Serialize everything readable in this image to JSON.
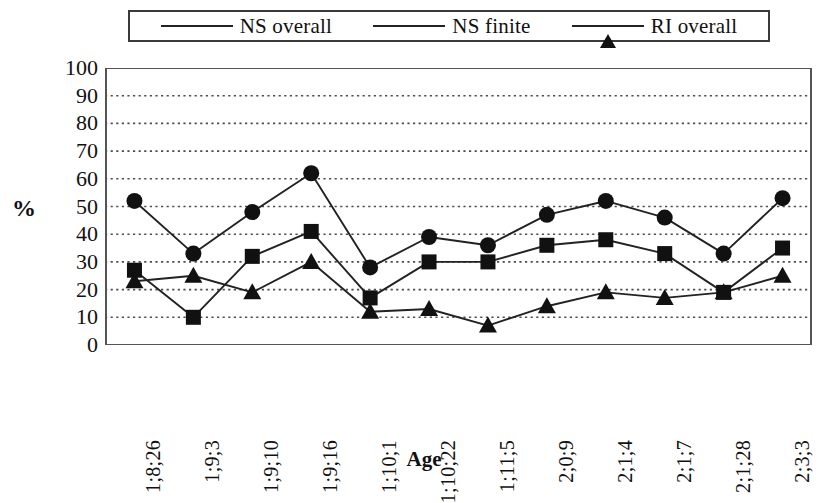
{
  "chart_data": {
    "type": "line",
    "title": "",
    "xlabel": "Age",
    "ylabel": "%",
    "ylim": [
      0,
      100
    ],
    "ytick_labels": [
      "100",
      "90",
      "80",
      "70",
      "60",
      "50",
      "40",
      "30",
      "20",
      "10",
      "0"
    ],
    "ytick_values": [
      100,
      90,
      80,
      70,
      60,
      50,
      40,
      30,
      20,
      10,
      0
    ],
    "grid": "horizontal-dotted",
    "legend_position": "top",
    "categories": [
      "1;8;26",
      "1;9;3",
      "1;9;10",
      "1;9;16",
      "1;10;1",
      "1;10;22",
      "1;11;5",
      "2;0;9",
      "2;1;4",
      "2;1;7",
      "2;1;28",
      "2;3;3"
    ],
    "series": [
      {
        "name": "NS overall",
        "marker": "circle",
        "values": [
          52,
          33,
          48,
          62,
          28,
          39,
          36,
          47,
          52,
          46,
          33,
          53
        ]
      },
      {
        "name": "NS finite",
        "marker": "square",
        "values": [
          27,
          10,
          32,
          41,
          17,
          30,
          30,
          36,
          38,
          33,
          19,
          35
        ]
      },
      {
        "name": "RI overall",
        "marker": "triangle",
        "values": [
          23,
          25,
          19,
          30,
          12,
          13,
          7,
          14,
          19,
          17,
          19,
          25
        ]
      }
    ],
    "colors": {
      "line": "#222222",
      "marker": "#111111",
      "grid": "#4d4d4d",
      "axis": "#555555",
      "background": "#ffffff"
    }
  },
  "legend": {
    "entries": [
      {
        "label": "NS overall",
        "marker": "circle"
      },
      {
        "label": "NS finite",
        "marker": "square"
      },
      {
        "label": "RI overall",
        "marker": "triangle"
      }
    ]
  },
  "axes": {
    "y_title": "%",
    "x_title": "Age"
  }
}
